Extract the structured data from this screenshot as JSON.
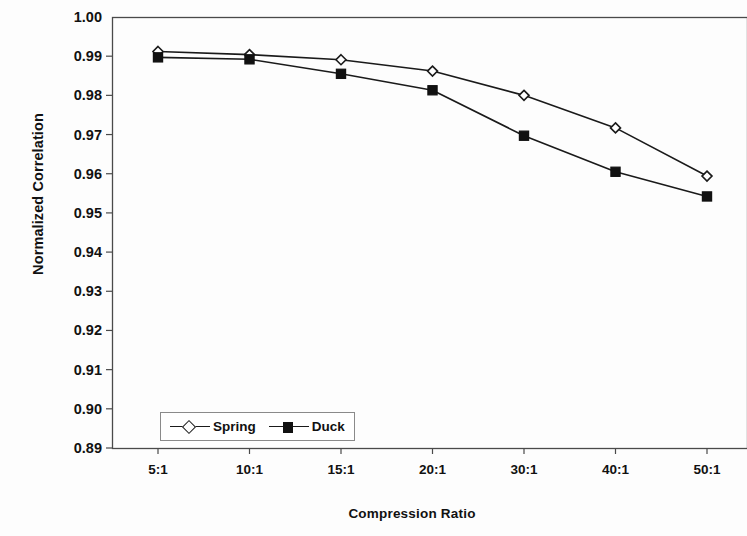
{
  "chart_data": {
    "type": "line",
    "title": "",
    "xlabel": "Compression Ratio",
    "ylabel": "Normalized Correlation",
    "categories": [
      "5:1",
      "10:1",
      "15:1",
      "20:1",
      "30:1",
      "40:1",
      "50:1"
    ],
    "ylim": [
      0.89,
      1.0
    ],
    "ytick_labels": [
      "1.00",
      "0.99",
      "0.98",
      "0.97",
      "0.96",
      "0.95",
      "0.94",
      "0.93",
      "0.92",
      "0.91",
      "0.90",
      "0.89"
    ],
    "ytick_values": [
      1.0,
      0.99,
      0.98,
      0.97,
      0.96,
      0.95,
      0.94,
      0.93,
      0.92,
      0.91,
      0.9,
      0.89
    ],
    "grid": false,
    "legend_position": "inside-bottom-left",
    "series": [
      {
        "name": "Spring",
        "marker": "open-diamond",
        "values": [
          0.9912,
          0.9904,
          0.9891,
          0.9862,
          0.98,
          0.9717,
          0.9594
        ]
      },
      {
        "name": "Duck",
        "marker": "filled-square",
        "values": [
          0.9897,
          0.9892,
          0.9855,
          0.9813,
          0.9697,
          0.9605,
          0.9542
        ]
      }
    ],
    "colors": {
      "line": "#1a1a1a",
      "axis": "#4a4a4a",
      "text": "#111111",
      "background": "#ffffff"
    }
  },
  "axes": {
    "x_title": "Compression Ratio",
    "y_title": "Normalized Correlation"
  },
  "legend": {
    "entries": [
      {
        "label": "Spring"
      },
      {
        "label": "Duck"
      }
    ]
  }
}
